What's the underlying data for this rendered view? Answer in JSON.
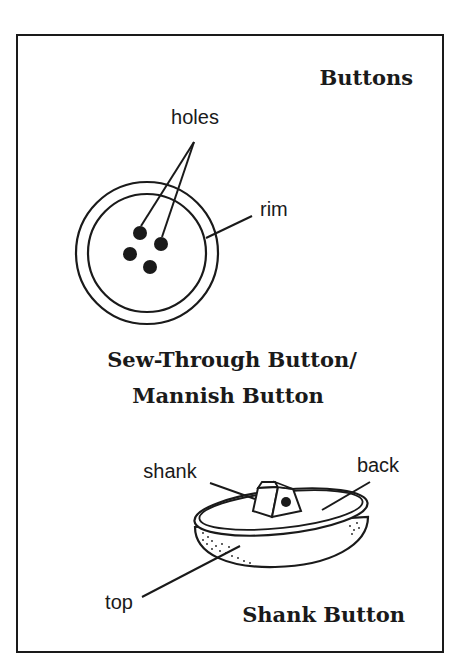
{
  "figure": {
    "title": "Buttons",
    "sew_through": {
      "caption_line1": "Sew-Through Button/",
      "caption_line2": "Mannish Button",
      "labels": {
        "holes": "holes",
        "rim": "rim"
      }
    },
    "shank_button": {
      "caption": "Shank Button",
      "labels": {
        "shank": "shank",
        "back": "back",
        "top": "top"
      }
    }
  },
  "colors": {
    "ink": "#1a1a1a",
    "background": "#ffffff"
  }
}
